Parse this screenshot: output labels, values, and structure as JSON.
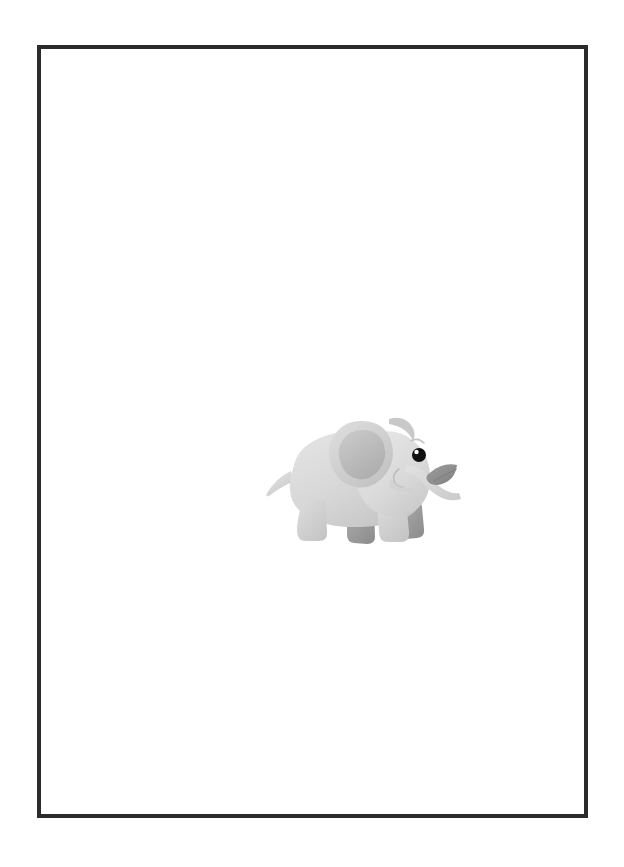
{
  "page": {
    "background_color": "#ffffff",
    "width": 624,
    "height": 867
  },
  "frame": {
    "name": "picture-frame",
    "border_color": "#2b2b2d",
    "border_width_px": 4,
    "mat_color": "#ffffff",
    "left": 37,
    "top": 45,
    "width": 551,
    "height": 773
  },
  "artwork": {
    "title": "Baby Elephant",
    "subject": "cartoon baby elephant holding a leaf in its trunk",
    "style": "flat pastel clip-art",
    "position": {
      "left": 200,
      "top": 360,
      "width": 220,
      "height": 145
    },
    "colors": {
      "body_light": "#dcdcdc",
      "body_base": "#d2d2d2",
      "body_shadow": "#c3c3c3",
      "ear_inner": "#b5b5b5",
      "leg_back": "#a3a3a3",
      "leg_back_shadow": "#8f8f8f",
      "leaf": "#8f8f8f",
      "eye": "#111111",
      "eye_highlight": "#ffffff",
      "mouth_line": "#b0b0b0"
    },
    "parts": [
      {
        "name": "head",
        "label": "Head"
      },
      {
        "name": "ear",
        "label": "Ear"
      },
      {
        "name": "ear-inner",
        "label": "Inner ear"
      },
      {
        "name": "eye",
        "label": "Eye"
      },
      {
        "name": "eye-highlight",
        "label": "Eye highlight"
      },
      {
        "name": "eyebrow",
        "label": "Eyebrow"
      },
      {
        "name": "trunk",
        "label": "Trunk"
      },
      {
        "name": "leaf",
        "label": "Leaf held in trunk"
      },
      {
        "name": "mouth",
        "label": "Mouth"
      },
      {
        "name": "body",
        "label": "Body"
      },
      {
        "name": "tail",
        "label": "Tail"
      },
      {
        "name": "front-leg-near",
        "label": "Front leg (near)"
      },
      {
        "name": "front-leg-far",
        "label": "Front leg (far)"
      },
      {
        "name": "back-leg-near",
        "label": "Back leg (near)"
      },
      {
        "name": "back-leg-far",
        "label": "Back leg (far)"
      }
    ]
  },
  "text": {
    "visible_text": ""
  }
}
